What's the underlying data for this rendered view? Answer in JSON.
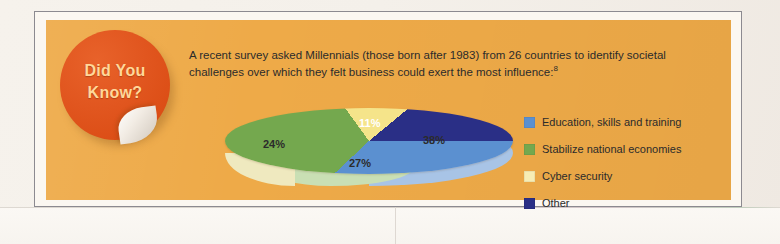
{
  "badge": {
    "line1": "Did You",
    "line2": "Know?",
    "color": "#e1561f",
    "text_color": "#ffd89a"
  },
  "body_copy": {
    "line1": "A recent survey asked Millennials (those born after 1983) from 26 countries to identify societal",
    "line2": "challenges over which they felt business could exert the most influence:",
    "footnote_marker": "8"
  },
  "panel": {
    "background": "#eeaa48",
    "frame_border": "#8c8a90",
    "frame_inset": "#fbf7f1",
    "page_background": "#f3efe9"
  },
  "chart_data": {
    "type": "pie",
    "title": "",
    "categories": [
      "Education, skills and training",
      "Stabilize national economies",
      "Cyber security",
      "Other"
    ],
    "values": [
      38,
      27,
      24,
      11
    ],
    "value_labels": [
      "38%",
      "27%",
      "24%",
      "11%"
    ],
    "colors": [
      "#5b90d0",
      "#74a84e",
      "#f5e48a",
      "#2a2f86"
    ],
    "side_colors": [
      "#a8c4e6",
      "#c9dfb4",
      "#efe9bf",
      "#2a2f86"
    ],
    "legend_position": "right",
    "grid": false,
    "units": "percent",
    "three_d": true
  }
}
